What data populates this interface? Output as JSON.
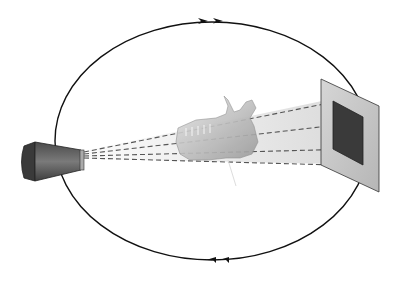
{
  "diagram": {
    "type": "CT scanner rotation schematic",
    "components": [
      {
        "id": "xray-source",
        "label": "X-ray tube (source)"
      },
      {
        "id": "beam",
        "label": "Cone beam (dashed rays)"
      },
      {
        "id": "object",
        "label": "Mandible (scanned object)"
      },
      {
        "id": "detector",
        "label": "Flat panel detector"
      },
      {
        "id": "orbit",
        "label": "Circular rotation path",
        "direction": "clockwise"
      }
    ],
    "colors": {
      "line": "#111111",
      "source_body": "#555555",
      "source_dark": "#333333",
      "beam_fill": "#d8d8d8",
      "detector_panel": "#c8c8c8",
      "detector_active": "#3a3a3a",
      "bone": "#b8b8b8"
    }
  }
}
